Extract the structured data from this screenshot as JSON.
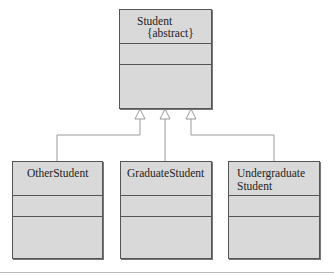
{
  "diagram": {
    "type": "UML class diagram (inheritance)",
    "parent": {
      "name": "Student",
      "stereotype": "{abstract}"
    },
    "children": [
      {
        "name": "OtherStudent"
      },
      {
        "name": "GraduateStudent"
      },
      {
        "name_line1": "Undergraduate",
        "name_line2": "Student"
      }
    ],
    "relationship": "generalization",
    "colors": {
      "box_fill": "#d9d9d9",
      "border": "#555555",
      "connector": "#999999"
    }
  }
}
